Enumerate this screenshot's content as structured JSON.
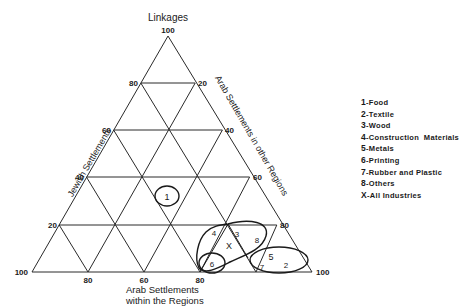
{
  "diagram": {
    "type": "ternary",
    "axes": {
      "top": {
        "label": "Linkages",
        "apex_value": "100"
      },
      "left": {
        "label": "Jewish Settlements",
        "ticks": [
          "80",
          "60",
          "40",
          "20"
        ],
        "vertex_value": "100"
      },
      "right": {
        "label": "Arab Settlements in other Regions",
        "ticks": [
          "20",
          "40",
          "60",
          "80"
        ],
        "vertex_value": "100"
      },
      "bottom": {
        "label_line1": "Arab Settlements",
        "label_line2": "within the Regions",
        "ticks": [
          "80",
          "60",
          "80"
        ]
      }
    },
    "point_labels": {
      "p1": "1",
      "p2": "2",
      "p3": "3",
      "p4": "4",
      "p5": "5",
      "p6": "6",
      "p7": "7",
      "p8": "8",
      "pX": "X"
    }
  },
  "legend": {
    "items": [
      {
        "key": "1",
        "label": "Food"
      },
      {
        "key": "2",
        "label": "Textile"
      },
      {
        "key": "3",
        "label": "Wood"
      },
      {
        "key": "4",
        "label": "Construction  Materials"
      },
      {
        "key": "5",
        "label": "Metals"
      },
      {
        "key": "6",
        "label": "Printing"
      },
      {
        "key": "7",
        "label": "Rubber and Plastic"
      },
      {
        "key": "8",
        "label": "Others"
      },
      {
        "key": "X",
        "label": "All Industries"
      }
    ]
  }
}
